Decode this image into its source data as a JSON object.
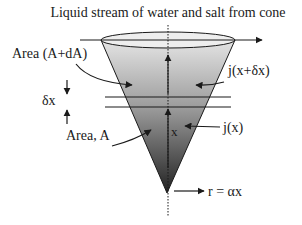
{
  "title": "Liquid stream of water and salt from cone",
  "labels": {
    "area_top": "Area (A+dA)",
    "delta_x": "δx",
    "area_bottom": "Area, A",
    "flux_top": "j(x+δx)",
    "flux_bottom": "j(x)",
    "axis_x": "x",
    "radius": "r = αx"
  },
  "colors": {
    "cone_top": "#e2e2e2",
    "cone_bottom": "#2a2a2a",
    "stroke": "#1a1a1a"
  }
}
